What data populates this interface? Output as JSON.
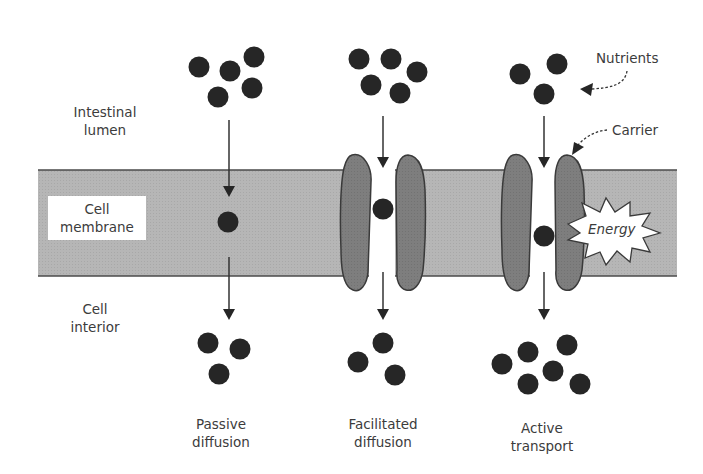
{
  "diagram": {
    "regions": {
      "lumen": {
        "line1": "Intestinal",
        "line2": "lumen"
      },
      "membrane": {
        "line1": "Cell",
        "line2": "membrane"
      },
      "interior": {
        "line1": "Cell",
        "line2": "interior"
      }
    },
    "callouts": {
      "nutrients": "Nutrients",
      "carrier": "Carrier",
      "energy": "Energy"
    },
    "mechanisms": [
      {
        "id": "passive",
        "line1": "Passive",
        "line2": "diffusion",
        "dots_above": 5,
        "dots_in_membrane": 1,
        "dots_below": 3,
        "has_carrier": false,
        "requires_energy": false
      },
      {
        "id": "facilitated",
        "line1": "Facilitated",
        "line2": "diffusion",
        "dots_above": 5,
        "dots_in_membrane": 1,
        "dots_below": 3,
        "has_carrier": true,
        "requires_energy": false
      },
      {
        "id": "active",
        "line1": "Active",
        "line2": "transport",
        "dots_above": 3,
        "dots_in_membrane": 1,
        "dots_below": 6,
        "has_carrier": true,
        "requires_energy": true
      }
    ],
    "colors": {
      "membrane": "#b4b4b4",
      "carrier": "#7d7d7d",
      "nutrient": "#262626",
      "outline": "#3a3a3a"
    }
  }
}
